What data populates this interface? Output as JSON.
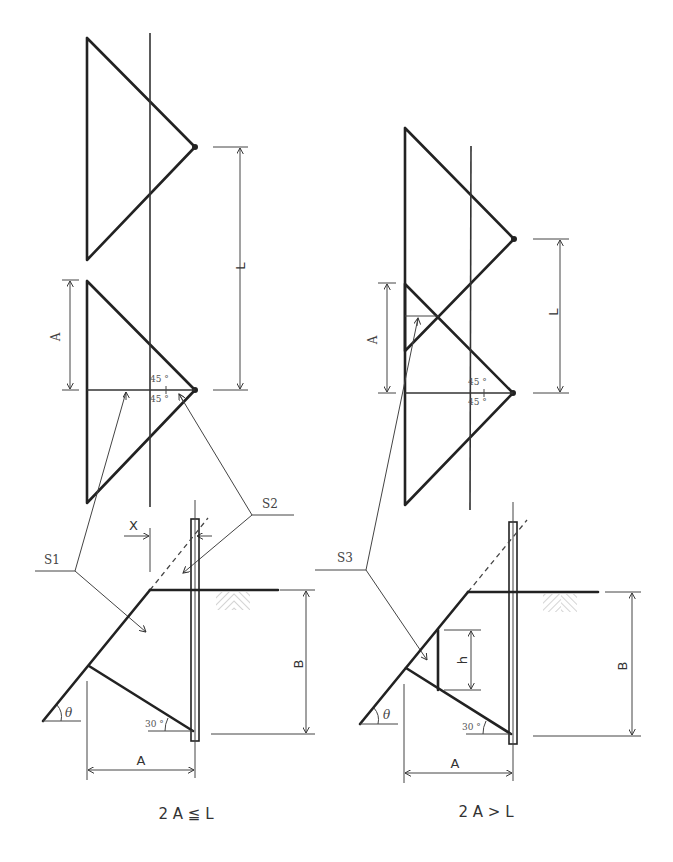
{
  "left_panel": {
    "caption": "2 A ≦ L",
    "labels": {
      "L": "L",
      "A_top": "A",
      "angle_upper": "45 °",
      "angle_lower": "45 °",
      "S1": "S1",
      "S2": "S2",
      "X": "X",
      "B": "B",
      "theta": "θ",
      "angle_30": "30 °",
      "A_bottom": "A"
    }
  },
  "right_panel": {
    "caption": "2 A > L",
    "labels": {
      "L": "L",
      "A_top": "A",
      "angle_upper": "45 °",
      "angle_lower": "45 °",
      "S3": "S3",
      "h": "h",
      "B": "B",
      "theta": "θ",
      "angle_30": "30 °",
      "A_bottom": "A"
    }
  },
  "colors": {
    "line": "#222222",
    "background": "#ffffff",
    "hatch": "#aaaaaa"
  }
}
